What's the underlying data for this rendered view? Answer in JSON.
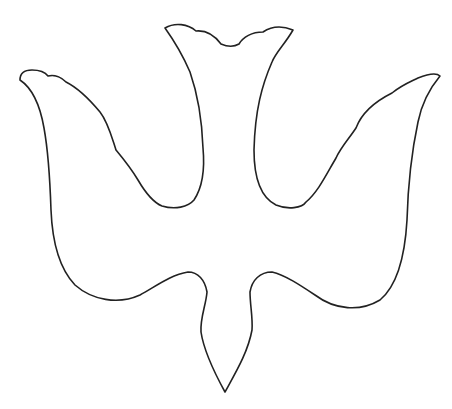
{
  "image": {
    "subject": "dove outline",
    "description": "Line-art outline of a descending dove (Holy Spirit symbol) with scalloped tail at top, outstretched wings, and pointed head at bottom",
    "stroke_color": "#222222",
    "background_color": "#ffffff"
  },
  "caption": {
    "text": "",
    "note": "cropped illegible text strip at bottom edge"
  }
}
